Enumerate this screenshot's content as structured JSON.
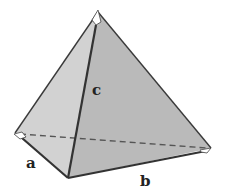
{
  "diagram": {
    "type": "tetrahedron",
    "labels": {
      "a": "a",
      "b": "b",
      "c": "c"
    },
    "vertices": {
      "apex": [
        98,
        12
      ],
      "left": [
        15,
        133
      ],
      "front": [
        68,
        178
      ],
      "right": [
        211,
        148
      ]
    },
    "colors": {
      "left_face": "#cfcfcf",
      "right_face": "#bdbdbd",
      "base_face": "#c8c8c8",
      "edge": "#3a3a3a",
      "hidden_edge": "#555555"
    }
  }
}
